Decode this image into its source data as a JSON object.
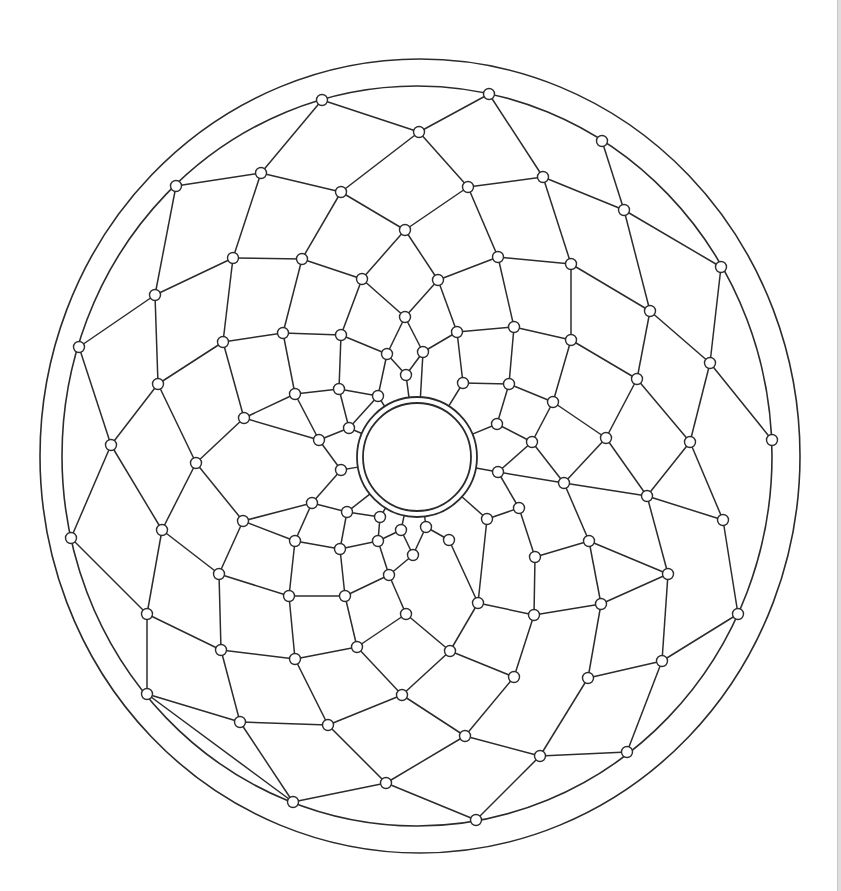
{
  "style": {
    "stroke_color": "#2b2b2b",
    "node_fill": "#ffffff",
    "background": "#ffffff",
    "edge_color": "#c8c8c8"
  },
  "diagram": {
    "type": "spiral-mesh mandala",
    "boundary_rings": 2,
    "center_rings": 2,
    "node_count": 160
  }
}
